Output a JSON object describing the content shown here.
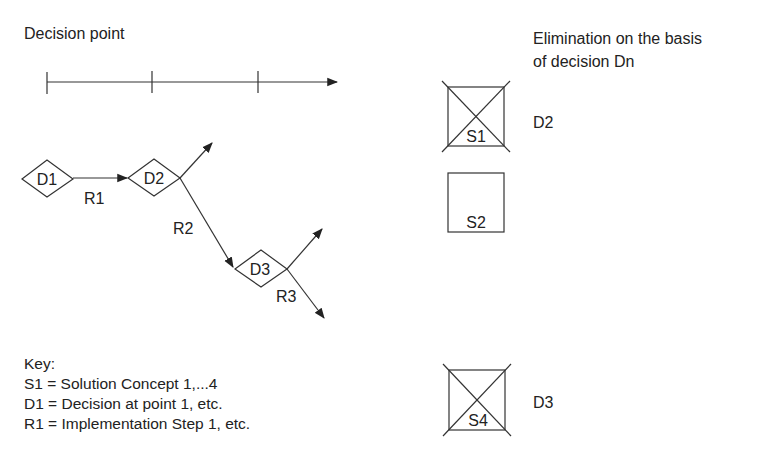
{
  "header": {
    "left_title": "Decision point",
    "right_title_line1": "Elimination on the basis",
    "right_title_line2": "of decision Dn"
  },
  "timeline": {
    "ticks": 3,
    "has_arrow": true
  },
  "decisions": [
    {
      "id": "D1",
      "label": "D1"
    },
    {
      "id": "D2",
      "label": "D2"
    },
    {
      "id": "D3",
      "label": "D3"
    }
  ],
  "routes": [
    {
      "id": "R1",
      "label": "R1"
    },
    {
      "id": "R2",
      "label": "R2"
    },
    {
      "id": "R3",
      "label": "R3"
    }
  ],
  "solutions": [
    {
      "id": "S1",
      "label": "S1",
      "eliminated": true,
      "eliminated_by": "D2"
    },
    {
      "id": "S2",
      "label": "S2",
      "eliminated": false,
      "eliminated_by": ""
    },
    {
      "id": "S4",
      "label": "S4",
      "eliminated": true,
      "eliminated_by": "D3"
    }
  ],
  "key": {
    "title": "Key:",
    "items": [
      "S1 = Solution Concept 1,...4",
      "D1 = Decision at point 1, etc.",
      "R1 = Implementation Step 1, etc."
    ]
  },
  "colors": {
    "stroke": "#333333",
    "background": "#ffffff"
  }
}
